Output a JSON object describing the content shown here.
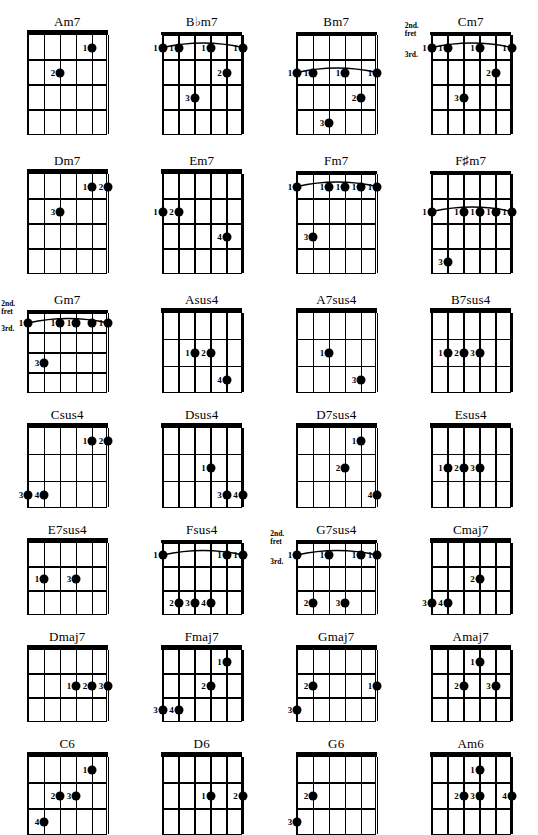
{
  "page": {
    "kind": "guitar-chord-chart",
    "rows": 7,
    "columns": 4,
    "strings": 6,
    "finger_labels": [
      "1",
      "2",
      "3",
      "4"
    ],
    "fret_marker_labels": {
      "second": "2nd.",
      "fret_word": "fret",
      "third": "3rd."
    },
    "ink_color": "#000000",
    "paper_color": "#ffffff"
  },
  "chords": [
    [
      {
        "name": "Am7",
        "frets": 4,
        "width": 80,
        "height": 100,
        "barre": null,
        "fret_markers": null,
        "dots": [
          {
            "string": 5,
            "fret": 1,
            "finger": "1"
          },
          {
            "string": 3,
            "fret": 2,
            "finger": "2"
          }
        ]
      },
      {
        "name": "B♭m7",
        "frets": 4,
        "width": 80,
        "height": 100,
        "barre": {
          "fret": 1,
          "from": 1,
          "to": 6
        },
        "fret_markers": null,
        "dots": [
          {
            "string": 1,
            "fret": 1,
            "finger": "1"
          },
          {
            "string": 2,
            "fret": 1,
            "finger": "1"
          },
          {
            "string": 4,
            "fret": 1,
            "finger": "1"
          },
          {
            "string": 6,
            "fret": 1,
            "finger": "1"
          },
          {
            "string": 5,
            "fret": 2,
            "finger": "2"
          },
          {
            "string": 3,
            "fret": 3,
            "finger": "3"
          }
        ]
      },
      {
        "name": "Bm7",
        "frets": 4,
        "width": 80,
        "height": 100,
        "barre": {
          "fret": 2,
          "from": 1,
          "to": 6
        },
        "fret_markers": null,
        "dots": [
          {
            "string": 1,
            "fret": 2,
            "finger": "1"
          },
          {
            "string": 2,
            "fret": 2,
            "finger": "1"
          },
          {
            "string": 4,
            "fret": 2,
            "finger": "1"
          },
          {
            "string": 6,
            "fret": 2,
            "finger": "1"
          },
          {
            "string": 5,
            "fret": 3,
            "finger": "2"
          },
          {
            "string": 3,
            "fret": 4,
            "finger": "3"
          }
        ]
      },
      {
        "name": "Cm7",
        "frets": 4,
        "width": 80,
        "height": 100,
        "barre": {
          "fret": 1,
          "from": 1,
          "to": 6
        },
        "fret_markers": {
          "above": true,
          "below": true
        },
        "dots": [
          {
            "string": 1,
            "fret": 1,
            "finger": "1"
          },
          {
            "string": 2,
            "fret": 1,
            "finger": "1"
          },
          {
            "string": 4,
            "fret": 1,
            "finger": "1"
          },
          {
            "string": 6,
            "fret": 1,
            "finger": "1"
          },
          {
            "string": 5,
            "fret": 2,
            "finger": "2"
          },
          {
            "string": 3,
            "fret": 3,
            "finger": "3"
          }
        ]
      }
    ],
    [
      {
        "name": "Dm7",
        "frets": 4,
        "width": 80,
        "height": 100,
        "barre": null,
        "fret_markers": null,
        "dots": [
          {
            "string": 5,
            "fret": 1,
            "finger": "1"
          },
          {
            "string": 6,
            "fret": 1,
            "finger": "2"
          },
          {
            "string": 3,
            "fret": 2,
            "finger": "3"
          }
        ]
      },
      {
        "name": "Em7",
        "frets": 4,
        "width": 80,
        "height": 100,
        "barre": null,
        "fret_markers": null,
        "dots": [
          {
            "string": 1,
            "fret": 2,
            "finger": "1"
          },
          {
            "string": 2,
            "fret": 2,
            "finger": "2"
          },
          {
            "string": 5,
            "fret": 3,
            "finger": "4"
          }
        ]
      },
      {
        "name": "Fm7",
        "frets": 4,
        "width": 80,
        "height": 100,
        "barre": {
          "fret": 1,
          "from": 1,
          "to": 6
        },
        "fret_markers": null,
        "dots": [
          {
            "string": 1,
            "fret": 1,
            "finger": "1"
          },
          {
            "string": 3,
            "fret": 1,
            "finger": "1"
          },
          {
            "string": 4,
            "fret": 1,
            "finger": "1"
          },
          {
            "string": 5,
            "fret": 1,
            "finger": "1"
          },
          {
            "string": 6,
            "fret": 1,
            "finger": "1"
          },
          {
            "string": 2,
            "fret": 3,
            "finger": "3"
          }
        ]
      },
      {
        "name": "F♯m7",
        "frets": 4,
        "width": 80,
        "height": 100,
        "barre": {
          "fret": 2,
          "from": 1,
          "to": 6
        },
        "fret_markers": null,
        "dots": [
          {
            "string": 1,
            "fret": 2,
            "finger": "1"
          },
          {
            "string": 3,
            "fret": 2,
            "finger": "1"
          },
          {
            "string": 4,
            "fret": 2,
            "finger": "1"
          },
          {
            "string": 5,
            "fret": 2,
            "finger": "1"
          },
          {
            "string": 6,
            "fret": 2,
            "finger": "1"
          },
          {
            "string": 2,
            "fret": 4,
            "finger": "3"
          }
        ]
      }
    ],
    [
      {
        "name": "Gm7",
        "frets": 4,
        "width": 80,
        "height": 80,
        "barre": {
          "fret": 1,
          "from": 1,
          "to": 6
        },
        "fret_markers": {
          "above": true,
          "below": true
        },
        "dots": [
          {
            "string": 1,
            "fret": 1,
            "finger": "1"
          },
          {
            "string": 3,
            "fret": 1,
            "finger": "1"
          },
          {
            "string": 4,
            "fret": 1,
            "finger": "1"
          },
          {
            "string": 5,
            "fret": 1,
            "finger": ""
          },
          {
            "string": 6,
            "fret": 1,
            "finger": "1"
          },
          {
            "string": 2,
            "fret": 3,
            "finger": "3"
          }
        ]
      },
      {
        "name": "Asus4",
        "frets": 3,
        "width": 80,
        "height": 80,
        "barre": null,
        "fret_markers": null,
        "dots": [
          {
            "string": 3,
            "fret": 2,
            "finger": "1"
          },
          {
            "string": 4,
            "fret": 2,
            "finger": "2"
          },
          {
            "string": 5,
            "fret": 3,
            "finger": "4"
          }
        ]
      },
      {
        "name": "A7sus4",
        "frets": 3,
        "width": 80,
        "height": 80,
        "barre": null,
        "fret_markers": null,
        "dots": [
          {
            "string": 3,
            "fret": 2,
            "finger": "1"
          },
          {
            "string": 5,
            "fret": 3,
            "finger": "3"
          }
        ]
      },
      {
        "name": "B7sus4",
        "frets": 3,
        "width": 80,
        "height": 80,
        "barre": null,
        "fret_markers": null,
        "dots": [
          {
            "string": 2,
            "fret": 2,
            "finger": "1"
          },
          {
            "string": 3,
            "fret": 2,
            "finger": "2"
          },
          {
            "string": 4,
            "fret": 2,
            "finger": "3"
          }
        ]
      }
    ],
    [
      {
        "name": "Csus4",
        "frets": 3,
        "width": 80,
        "height": 80,
        "barre": null,
        "fret_markers": null,
        "dots": [
          {
            "string": 5,
            "fret": 1,
            "finger": "1"
          },
          {
            "string": 6,
            "fret": 1,
            "finger": "2"
          },
          {
            "string": 1,
            "fret": 3,
            "finger": "3"
          },
          {
            "string": 2,
            "fret": 3,
            "finger": "4"
          }
        ]
      },
      {
        "name": "Dsus4",
        "frets": 3,
        "width": 80,
        "height": 80,
        "barre": null,
        "fret_markers": null,
        "dots": [
          {
            "string": 4,
            "fret": 2,
            "finger": "1"
          },
          {
            "string": 5,
            "fret": 3,
            "finger": "3"
          },
          {
            "string": 6,
            "fret": 3,
            "finger": "4"
          }
        ]
      },
      {
        "name": "D7sus4",
        "frets": 3,
        "width": 80,
        "height": 80,
        "barre": null,
        "fret_markers": null,
        "dots": [
          {
            "string": 5,
            "fret": 1,
            "finger": "1"
          },
          {
            "string": 4,
            "fret": 2,
            "finger": "2"
          },
          {
            "string": 6,
            "fret": 3,
            "finger": "4"
          }
        ]
      },
      {
        "name": "Esus4",
        "frets": 3,
        "width": 80,
        "height": 80,
        "barre": null,
        "fret_markers": null,
        "dots": [
          {
            "string": 2,
            "fret": 2,
            "finger": "1"
          },
          {
            "string": 3,
            "fret": 2,
            "finger": "2"
          },
          {
            "string": 4,
            "fret": 2,
            "finger": "3"
          }
        ]
      }
    ],
    [
      {
        "name": "E7sus4",
        "frets": 3,
        "width": 80,
        "height": 72,
        "barre": null,
        "fret_markers": null,
        "dots": [
          {
            "string": 2,
            "fret": 2,
            "finger": "1"
          },
          {
            "string": 4,
            "fret": 2,
            "finger": "3"
          }
        ]
      },
      {
        "name": "Fsus4",
        "frets": 3,
        "width": 80,
        "height": 72,
        "barre": {
          "fret": 1,
          "from": 1,
          "to": 6
        },
        "fret_markers": null,
        "dots": [
          {
            "string": 1,
            "fret": 1,
            "finger": "1"
          },
          {
            "string": 5,
            "fret": 1,
            "finger": "1"
          },
          {
            "string": 6,
            "fret": 1,
            "finger": "1"
          },
          {
            "string": 2,
            "fret": 3,
            "finger": "2"
          },
          {
            "string": 3,
            "fret": 3,
            "finger": "3"
          },
          {
            "string": 4,
            "fret": 3,
            "finger": "4"
          }
        ]
      },
      {
        "name": "G7sus4",
        "frets": 3,
        "width": 80,
        "height": 72,
        "barre": {
          "fret": 1,
          "from": 1,
          "to": 6
        },
        "fret_markers": {
          "above": true,
          "below": true
        },
        "dots": [
          {
            "string": 1,
            "fret": 1,
            "finger": "1"
          },
          {
            "string": 3,
            "fret": 1,
            "finger": "1"
          },
          {
            "string": 5,
            "fret": 1,
            "finger": "1"
          },
          {
            "string": 6,
            "fret": 1,
            "finger": "1"
          },
          {
            "string": 2,
            "fret": 3,
            "finger": "2"
          },
          {
            "string": 4,
            "fret": 3,
            "finger": "3"
          }
        ]
      },
      {
        "name": "Cmaj7",
        "frets": 3,
        "width": 80,
        "height": 72,
        "barre": null,
        "fret_markers": null,
        "dots": [
          {
            "string": 4,
            "fret": 2,
            "finger": "2"
          },
          {
            "string": 1,
            "fret": 3,
            "finger": "3"
          },
          {
            "string": 2,
            "fret": 3,
            "finger": "4"
          }
        ]
      }
    ],
    [
      {
        "name": "Dmaj7",
        "frets": 3,
        "width": 80,
        "height": 72,
        "barre": null,
        "fret_markers": null,
        "dots": [
          {
            "string": 4,
            "fret": 2,
            "finger": "1"
          },
          {
            "string": 5,
            "fret": 2,
            "finger": "2"
          },
          {
            "string": 6,
            "fret": 2,
            "finger": "3"
          }
        ]
      },
      {
        "name": "Fmaj7",
        "frets": 3,
        "width": 80,
        "height": 72,
        "barre": null,
        "fret_markers": null,
        "dots": [
          {
            "string": 5,
            "fret": 1,
            "finger": "1"
          },
          {
            "string": 4,
            "fret": 2,
            "finger": "2"
          },
          {
            "string": 1,
            "fret": 3,
            "finger": "3"
          },
          {
            "string": 2,
            "fret": 3,
            "finger": "4"
          }
        ]
      },
      {
        "name": "Gmaj7",
        "frets": 3,
        "width": 80,
        "height": 72,
        "barre": null,
        "fret_markers": null,
        "dots": [
          {
            "string": 2,
            "fret": 2,
            "finger": "2"
          },
          {
            "string": 6,
            "fret": 2,
            "finger": "1"
          },
          {
            "string": 1,
            "fret": 3,
            "finger": "3"
          }
        ]
      },
      {
        "name": "Amaj7",
        "frets": 3,
        "width": 80,
        "height": 72,
        "barre": null,
        "fret_markers": null,
        "dots": [
          {
            "string": 4,
            "fret": 1,
            "finger": "1"
          },
          {
            "string": 3,
            "fret": 2,
            "finger": "2"
          },
          {
            "string": 5,
            "fret": 2,
            "finger": "3"
          }
        ]
      }
    ],
    [
      {
        "name": "C6",
        "frets": 3,
        "width": 80,
        "height": 78,
        "barre": null,
        "fret_markers": null,
        "dots": [
          {
            "string": 5,
            "fret": 1,
            "finger": "1"
          },
          {
            "string": 3,
            "fret": 2,
            "finger": "2"
          },
          {
            "string": 4,
            "fret": 2,
            "finger": "3"
          },
          {
            "string": 2,
            "fret": 3,
            "finger": "4"
          }
        ]
      },
      {
        "name": "D6",
        "frets": 3,
        "width": 80,
        "height": 78,
        "barre": null,
        "fret_markers": null,
        "dots": [
          {
            "string": 4,
            "fret": 2,
            "finger": "1"
          },
          {
            "string": 6,
            "fret": 2,
            "finger": "2"
          }
        ]
      },
      {
        "name": "G6",
        "frets": 3,
        "width": 80,
        "height": 78,
        "barre": null,
        "fret_markers": null,
        "dots": [
          {
            "string": 2,
            "fret": 2,
            "finger": "2"
          },
          {
            "string": 1,
            "fret": 3,
            "finger": "3"
          }
        ]
      },
      {
        "name": "Am6",
        "frets": 3,
        "width": 80,
        "height": 78,
        "barre": null,
        "fret_markers": null,
        "dots": [
          {
            "string": 4,
            "fret": 1,
            "finger": "1"
          },
          {
            "string": 3,
            "fret": 2,
            "finger": "2"
          },
          {
            "string": 4,
            "fret": 2,
            "finger": "3"
          },
          {
            "string": 6,
            "fret": 2,
            "finger": "4"
          }
        ]
      }
    ]
  ]
}
